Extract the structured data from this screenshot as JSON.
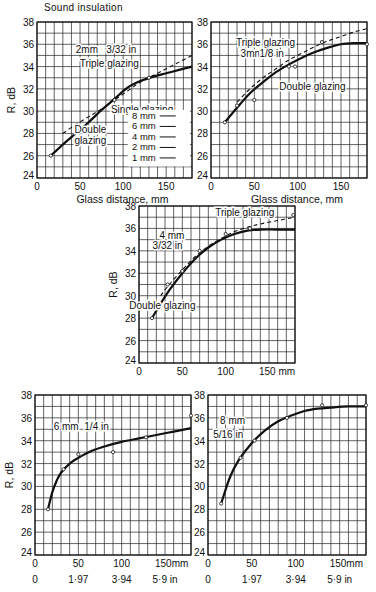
{
  "page": {
    "title": "Sound insulation"
  },
  "chart_data": [
    {
      "id": "chart-2mm",
      "type": "line",
      "title": "2mm 3/32 in",
      "xlabel": "Glass distance, mm",
      "ylabel": "R, dB",
      "xlim": [
        0,
        180
      ],
      "ylim": [
        24,
        38
      ],
      "x_ticks": [
        0,
        50,
        100,
        150
      ],
      "x_tick_labels": [
        "0",
        "50",
        "100",
        "150"
      ],
      "y_ticks": [
        24,
        26,
        28,
        30,
        32,
        34,
        36,
        38
      ],
      "grid": true,
      "grid_x_step": 10,
      "grid_y_step": 1,
      "box": {
        "left": 37,
        "top": 22,
        "right": 192,
        "bottom": 178
      },
      "annotations": [
        {
          "text": "2mm",
          "x": 58,
          "y": 35.6
        },
        {
          "text": "3/32 in",
          "x": 98,
          "y": 35.6
        },
        {
          "text": "Triple glazing",
          "x": 84,
          "y": 34.3
        },
        {
          "text": "Single glazing",
          "x": 122,
          "y": 30.2
        },
        {
          "text": "Double",
          "x": 62,
          "y": 28.4
        },
        {
          "text": "glazing",
          "x": 62,
          "y": 27.4
        }
      ],
      "legend": {
        "title": "Single glazing",
        "entries": [
          "8 mm",
          "6 mm",
          "4 mm",
          "2 mm",
          "1 mm"
        ],
        "position": "lower right"
      },
      "series": [
        {
          "name": "Double glazing",
          "style": "solid",
          "x": [
            16,
            30,
            45,
            60,
            75,
            90,
            105,
            120,
            135,
            150,
            165,
            180
          ],
          "y": [
            26.0,
            27.0,
            28.0,
            29.0,
            30.1,
            31.1,
            32.1,
            32.7,
            33.1,
            33.4,
            33.7,
            34.0
          ]
        },
        {
          "name": "Triple glazing",
          "style": "dashed",
          "x": [
            30,
            45,
            60,
            75,
            90,
            105,
            120,
            135,
            150,
            165,
            180
          ],
          "y": [
            28.0,
            28.8,
            29.5,
            30.2,
            31.0,
            31.8,
            32.6,
            33.2,
            33.8,
            34.4,
            35.0
          ]
        },
        {
          "name": "Double glazing (measured)",
          "style": "points",
          "x": [
            16,
            90,
            130
          ],
          "y": [
            26.0,
            31.0,
            33.0
          ]
        }
      ]
    },
    {
      "id": "chart-3mm",
      "type": "line",
      "title": "3mm 1/8 in",
      "xlabel": "Glass distance, mm",
      "ylabel": "",
      "xlim": [
        0,
        180
      ],
      "ylim": [
        24,
        38
      ],
      "x_ticks": [
        0,
        50,
        100,
        150
      ],
      "x_tick_labels": [
        "0",
        "50",
        "100",
        "150"
      ],
      "y_ticks": [
        24,
        26,
        28,
        30,
        32,
        34,
        36,
        38
      ],
      "grid": true,
      "grid_x_step": 10,
      "grid_y_step": 1,
      "box": {
        "left": 211,
        "top": 22,
        "right": 367,
        "bottom": 178
      },
      "annotations": [
        {
          "text": "Triple glazing",
          "x": 63,
          "y": 36.2
        },
        {
          "text": "3mm",
          "x": 47,
          "y": 35.2
        },
        {
          "text": "1/8 in",
          "x": 70,
          "y": 35.2
        },
        {
          "text": "Double glazing",
          "x": 117,
          "y": 32.3
        }
      ],
      "series": [
        {
          "name": "Double glazing",
          "style": "solid",
          "x": [
            16,
            30,
            45,
            60,
            75,
            90,
            105,
            120,
            135,
            150,
            165,
            180
          ],
          "y": [
            29.0,
            30.3,
            31.6,
            32.6,
            33.5,
            34.2,
            34.8,
            35.3,
            35.7,
            36.0,
            36.1,
            36.1
          ]
        },
        {
          "name": "Triple glazing",
          "style": "dashed",
          "x": [
            30,
            45,
            60,
            75,
            90,
            105,
            120,
            135,
            150,
            165,
            180
          ],
          "y": [
            30.8,
            32.0,
            33.0,
            33.8,
            34.6,
            35.2,
            35.8,
            36.3,
            36.7,
            37.1,
            37.4
          ]
        },
        {
          "name": "Measured points",
          "style": "points",
          "x": [
            16,
            30,
            50,
            90,
            97,
            128,
            180
          ],
          "y": [
            29.0,
            30.5,
            31.0,
            34.0,
            34.0,
            36.2,
            36.0
          ]
        }
      ]
    },
    {
      "id": "chart-4mm",
      "type": "line",
      "title": "4 mm 3/32 in",
      "xlabel": "mm",
      "ylabel": "R, dB",
      "xlim": [
        0,
        180
      ],
      "ylim": [
        24,
        38
      ],
      "x_ticks": [
        0,
        50,
        100,
        150
      ],
      "x_tick_labels": [
        "0",
        "50",
        "100",
        "150 mm"
      ],
      "y_ticks": [
        24,
        26,
        28,
        30,
        32,
        34,
        36,
        38
      ],
      "grid": true,
      "grid_x_step": 10,
      "grid_y_step": 1,
      "box": {
        "left": 139,
        "top": 206,
        "right": 295,
        "bottom": 363
      },
      "annotations": [
        {
          "text": "Triple glazing",
          "x": 122,
          "y": 37.5
        },
        {
          "text": "4 mm",
          "x": 38,
          "y": 35.4
        },
        {
          "text": "3/32 in",
          "x": 33,
          "y": 34.5
        },
        {
          "text": "Double glazing",
          "x": 27,
          "y": 29.2
        }
      ],
      "series": [
        {
          "name": "Double glazing",
          "style": "solid",
          "x": [
            15,
            25,
            35,
            50,
            65,
            80,
            95,
            110,
            125,
            140,
            160,
            180
          ],
          "y": [
            28.0,
            29.3,
            30.5,
            32.0,
            33.3,
            34.3,
            35.0,
            35.5,
            35.8,
            35.9,
            35.9,
            35.9
          ]
        },
        {
          "name": "Triple glazing",
          "style": "dashed",
          "x": [
            25,
            35,
            50,
            65,
            80,
            95,
            110,
            125,
            140,
            160,
            180
          ],
          "y": [
            30.0,
            31.0,
            32.3,
            33.5,
            34.4,
            35.1,
            35.7,
            36.1,
            36.4,
            36.7,
            37.0
          ]
        },
        {
          "name": "Measured points",
          "style": "points",
          "x": [
            15,
            33,
            50,
            70,
            100,
            128,
            178
          ],
          "y": [
            28.0,
            31.0,
            32.2,
            34.0,
            35.5,
            36.0,
            37.2
          ]
        }
      ]
    },
    {
      "id": "chart-6mm",
      "type": "line",
      "title": "6 mm 1/4 in",
      "xlabel": "mm / in",
      "ylabel": "R, dB",
      "xlim": [
        0,
        180
      ],
      "ylim": [
        24,
        38
      ],
      "x_ticks": [
        0,
        50,
        100,
        150
      ],
      "x_tick_labels": [
        "0",
        "50",
        "100",
        "150mm"
      ],
      "x_tick_labels_in": [
        "0",
        "1·97",
        "3·94",
        "5·9 in"
      ],
      "y_ticks": [
        24,
        26,
        28,
        30,
        32,
        34,
        36,
        38
      ],
      "grid": true,
      "grid_x_step": 10,
      "grid_y_step": 1,
      "box": {
        "left": 35,
        "top": 395,
        "right": 191,
        "bottom": 555
      },
      "annotations": [
        {
          "text": "6 mm",
          "x": 36,
          "y": 35.3
        },
        {
          "text": "1/4 in",
          "x": 71,
          "y": 35.3
        }
      ],
      "series": [
        {
          "name": "Double glazing",
          "style": "solid",
          "x": [
            15,
            20,
            25,
            30,
            40,
            50,
            65,
            80,
            100,
            120,
            140,
            160,
            180
          ],
          "y": [
            28.0,
            29.5,
            30.5,
            31.2,
            32.0,
            32.5,
            33.1,
            33.5,
            33.9,
            34.2,
            34.5,
            34.8,
            35.1
          ]
        },
        {
          "name": "Measured points",
          "style": "points",
          "x": [
            15,
            33,
            50,
            90,
            128,
            180
          ],
          "y": [
            28.0,
            31.5,
            32.8,
            33.0,
            34.3,
            36.2
          ]
        }
      ]
    },
    {
      "id": "chart-8mm",
      "type": "line",
      "title": "8 mm 5/16 in",
      "xlabel": "mm / in",
      "ylabel": "",
      "xlim": [
        0,
        180
      ],
      "ylim": [
        24,
        38
      ],
      "x_ticks": [
        0,
        50,
        100,
        150
      ],
      "x_tick_labels": [
        "0",
        "50",
        "100",
        "150mm"
      ],
      "x_tick_labels_in": [
        "0",
        "1·97",
        "3·94",
        "5·9 in"
      ],
      "y_ticks": [
        24,
        26,
        28,
        30,
        32,
        34,
        36,
        38
      ],
      "grid": true,
      "grid_x_step": 10,
      "grid_y_step": 1,
      "box": {
        "left": 208,
        "top": 395,
        "right": 366,
        "bottom": 555
      },
      "annotations": [
        {
          "text": "8 mm",
          "x": 28,
          "y": 35.8
        },
        {
          "text": "5/16 in",
          "x": 23,
          "y": 34.6
        }
      ],
      "series": [
        {
          "name": "Double glazing",
          "style": "solid",
          "x": [
            15,
            25,
            35,
            50,
            65,
            80,
            95,
            110,
            125,
            140,
            160,
            180
          ],
          "y": [
            28.5,
            30.8,
            32.3,
            33.8,
            34.9,
            35.7,
            36.2,
            36.6,
            36.8,
            36.9,
            37.0,
            37.0
          ]
        },
        {
          "name": "Measured points",
          "style": "points",
          "x": [
            15,
            37,
            53,
            90,
            130,
            180
          ],
          "y": [
            28.5,
            32.5,
            34.0,
            36.0,
            37.1,
            37.1
          ]
        }
      ]
    }
  ]
}
